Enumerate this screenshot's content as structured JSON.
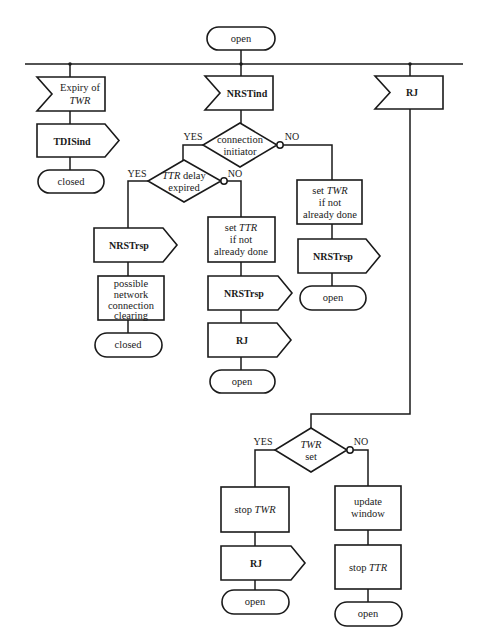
{
  "diagram": {
    "type": "SDL state transition flowchart",
    "start_state": {
      "label": "open"
    },
    "inputs": [
      {
        "id": "in-expiry",
        "lines": [
          "Expiry of",
          "TWR"
        ],
        "italic_line": 1
      },
      {
        "id": "in-nrstind",
        "lines": [
          "NRSTind"
        ]
      },
      {
        "id": "in-rj",
        "lines": [
          "RJ"
        ]
      }
    ],
    "branch_expiry": {
      "output": "TDISind",
      "state": "closed"
    },
    "branch_nrstind": {
      "decision1": {
        "lines": [
          "connection",
          "initiator"
        ],
        "yes": "YES",
        "no": "NO"
      },
      "decision2": {
        "lines": [
          "TTR delay",
          "expired"
        ],
        "italic_word": "TTR",
        "yes": "YES",
        "no": "NO"
      },
      "yes_yes": {
        "output": "NRSTrsp",
        "task": [
          "possible",
          "network",
          "connection",
          "clearing"
        ],
        "state": "closed"
      },
      "yes_no": {
        "task": [
          "set TTR",
          "if not",
          "already done"
        ],
        "task_italic_word": "TTR",
        "output1": "NRSTrsp",
        "output2": "RJ",
        "state": "open"
      },
      "no": {
        "task": [
          "set TWR",
          "if not",
          "already done"
        ],
        "task_italic_word": "TWR",
        "output": "NRSTrsp",
        "state": "open"
      }
    },
    "branch_rj": {
      "decision": {
        "lines": [
          "TWR",
          "set"
        ],
        "italic_word": "TWR",
        "yes": "YES",
        "no": "NO"
      },
      "yes": {
        "task": "stop TWR",
        "task_prefix": "stop",
        "task_italic": "TWR",
        "output": "RJ",
        "state": "open"
      },
      "no": {
        "task1": [
          "update",
          "window"
        ],
        "task2_prefix": "stop",
        "task2_italic": "TTR",
        "state": "open"
      }
    },
    "colors": {
      "stroke": "#1a1a1a",
      "background": "#ffffff"
    }
  }
}
